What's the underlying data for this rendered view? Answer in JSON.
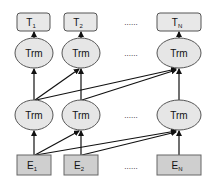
{
  "diagram": {
    "outputs": [
      {
        "label": "T",
        "sub": "1"
      },
      {
        "label": "T",
        "sub": "2"
      },
      {
        "label": "T",
        "sub": "N"
      }
    ],
    "top_layer": [
      {
        "label": "Trm"
      },
      {
        "label": "Trm"
      },
      {
        "label": "Trm"
      }
    ],
    "bottom_layer": [
      {
        "label": "Trm"
      },
      {
        "label": "Trm"
      },
      {
        "label": "Trm"
      }
    ],
    "inputs": [
      {
        "label": "E",
        "sub": "1"
      },
      {
        "label": "E",
        "sub": "2"
      },
      {
        "label": "E",
        "sub": "N"
      }
    ],
    "ellipsis": "......",
    "colors": {
      "box_fill": "#e8e8e8",
      "input_fill": "#cfcfcf",
      "node_fill": "#e6e6e6",
      "stroke": "#555555",
      "arrow": "#111111"
    }
  }
}
